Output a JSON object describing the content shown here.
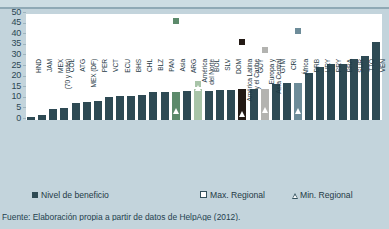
{
  "chart_data": {
    "type": "bar",
    "title": "",
    "xlabel": "",
    "ylabel": "",
    "ylim": [
      0,
      50
    ],
    "yticks": [
      0,
      5,
      10,
      15,
      20,
      25,
      30,
      35,
      40,
      45,
      50
    ],
    "grid": false,
    "legend_position": "bottom",
    "categories": [
      "HND",
      "JAM",
      "MEX\n(70 y más)",
      "COL",
      "ATG",
      "MEX (DF)",
      "PER",
      "VCT",
      "ECU",
      "BHS",
      "CHL",
      "BLZ",
      "PAN",
      "Asia",
      "ARG",
      "América\ndel Norte",
      "BOL",
      "SLV",
      "DOM",
      "América Latina\ny el Caribe",
      "GUY",
      "Europa y\nAsia Central",
      "GTM",
      "CRI",
      "África",
      "BRB",
      "URY",
      "PRY",
      "BRA",
      "SUR",
      "TTO",
      "VEN"
    ],
    "series": [
      {
        "name": "Nivel de beneficio",
        "values": [
          1.5,
          2.5,
          5.0,
          5.5,
          8.0,
          8.5,
          9.0,
          11.0,
          11.5,
          11.5,
          12.0,
          13.0,
          13.0,
          13.0,
          13.5,
          14.5,
          13.5,
          14.0,
          14.0,
          14.5,
          14.5,
          14.5,
          17.0,
          17.5,
          17.5,
          22.0,
          25.0,
          26.5,
          26.5,
          29.0,
          30.0,
          37.0
        ]
      }
    ],
    "markers": {
      "max_regional": {
        "label": "Max. Regional",
        "points": [
          {
            "category": "Asia",
            "value": 46.5
          },
          {
            "category": "América del Norte",
            "value": 17.0
          },
          {
            "category": "América Latina y el Caribe",
            "value": 37.0
          },
          {
            "category": "Europa y Asia Central",
            "value": 33.0
          },
          {
            "category": "África",
            "value": 42.0
          }
        ]
      },
      "min_regional": {
        "label": "Min. Regional",
        "points": [
          {
            "category": "Asia",
            "value": 3.0
          },
          {
            "category": "América del Norte",
            "value": 13.5
          },
          {
            "category": "América Latina y el Caribe",
            "value": 1.5
          },
          {
            "category": "Europa y Asia Central",
            "value": 3.5
          },
          {
            "category": "África",
            "value": 3.0
          }
        ]
      }
    },
    "series_colors": {
      "default": "#2e4a54",
      "Asia": "#5c8a6b",
      "América del Norte": "#a8c4a8",
      "América Latina y el Caribe": "#241a15",
      "Europa y Asia Central": "#b3b3b0",
      "África": "#6d8c99"
    }
  },
  "legend": {
    "benefit": "Nivel de beneficio",
    "max": "Max. Regional",
    "min": "Min. Regional"
  },
  "footer": {
    "source": "Fuente: Elaboración propia a partir de datos de HelpAge (2012)."
  }
}
